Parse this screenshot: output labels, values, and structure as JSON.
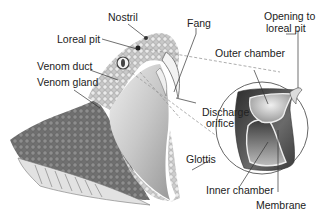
{
  "diagram": {
    "labels": {
      "nostril": "Nostril",
      "loreal_pit": "Loreal pit",
      "venom_duct": "Venom duct",
      "venom_gland": "Venom gland",
      "fang": "Fang",
      "discharge_orifice_1": "Discharge",
      "discharge_orifice_2": "orifice",
      "glottis": "Glottis",
      "opening_1": "Opening to",
      "opening_2": "loreal pit",
      "outer_chamber": "Outer chamber",
      "inner_chamber": "Inner chamber",
      "membrane": "Membrane"
    },
    "colors": {
      "label_text": "#222222",
      "leader_line": "#333333",
      "dashed_line": "#999999",
      "pit_dark": "#3a3a3a",
      "pit_light": "#d8d8d8"
    }
  }
}
